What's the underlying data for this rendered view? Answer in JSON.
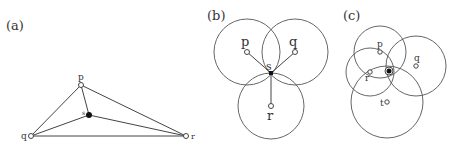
{
  "panels": [
    {
      "label": "(a)",
      "points": {
        "p": {
          "label": "p",
          "x": 81,
          "y": 85
        },
        "q": {
          "label": "q",
          "x": 31,
          "y": 136
        },
        "r": {
          "label": "r",
          "x": 186,
          "y": 136
        },
        "s": {
          "label": "s",
          "x": 89,
          "y": 115
        }
      }
    },
    {
      "label": "(b)",
      "points": {
        "p": {
          "label": "p",
          "x": 247,
          "y": 52
        },
        "q": {
          "label": "q",
          "x": 295,
          "y": 52
        },
        "r": {
          "label": "r",
          "x": 271,
          "y": 106
        },
        "s": {
          "label": "s",
          "x": 271,
          "y": 73
        }
      }
    },
    {
      "label": "(c)",
      "points": {
        "p": {
          "label": "p",
          "x": 380,
          "y": 52
        },
        "q": {
          "label": "q",
          "x": 416,
          "y": 66
        },
        "r": {
          "label": "r",
          "x": 370,
          "y": 72
        },
        "t": {
          "label": "t",
          "x": 387,
          "y": 102
        },
        "s": {
          "label": "",
          "x": 389,
          "y": 71
        }
      }
    }
  ]
}
